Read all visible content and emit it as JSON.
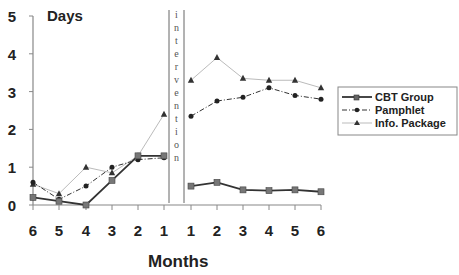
{
  "chart_data": {
    "type": "line",
    "title": "",
    "ylabel": "Days",
    "xlabel": "Months",
    "ylim": [
      0,
      5
    ],
    "yticks": [
      0,
      1,
      2,
      3,
      4,
      5
    ],
    "grid": false,
    "legend_position": "right",
    "annotation": "intervention",
    "pre_categories": [
      "6",
      "5",
      "4",
      "3",
      "2",
      "1"
    ],
    "post_categories": [
      "1",
      "2",
      "3",
      "4",
      "5",
      "6"
    ],
    "series": [
      {
        "name": "CBT Group",
        "marker": "square",
        "line": "solid",
        "color": "#333333",
        "pre": [
          0.2,
          0.1,
          0.0,
          0.65,
          1.3,
          1.3
        ],
        "post": [
          0.5,
          0.6,
          0.4,
          0.38,
          0.4,
          0.35
        ]
      },
      {
        "name": "Pamphlet",
        "marker": "circle",
        "line": "dash-dot",
        "color": "#222222",
        "pre": [
          0.6,
          0.15,
          0.5,
          1.0,
          1.2,
          1.25
        ],
        "post": [
          2.35,
          2.75,
          2.85,
          3.1,
          2.9,
          2.8
        ]
      },
      {
        "name": "Info. Package",
        "marker": "triangle",
        "line": "solid-light",
        "color": "#aaaaaa",
        "pre": [
          0.55,
          0.3,
          1.0,
          0.85,
          1.3,
          2.4
        ],
        "post": [
          3.3,
          3.9,
          3.35,
          3.3,
          3.3,
          3.1
        ]
      }
    ]
  },
  "labels": {
    "y_title": "Days",
    "x_title": "Months",
    "intervention": "intervention",
    "y_ticks": [
      "0",
      "1",
      "2",
      "3",
      "4",
      "5"
    ],
    "x_ticks": [
      "6",
      "5",
      "4",
      "3",
      "2",
      "1",
      "1",
      "2",
      "3",
      "4",
      "5",
      "6"
    ],
    "legend": [
      "CBT Group",
      "Pamphlet",
      "Info. Package"
    ]
  }
}
